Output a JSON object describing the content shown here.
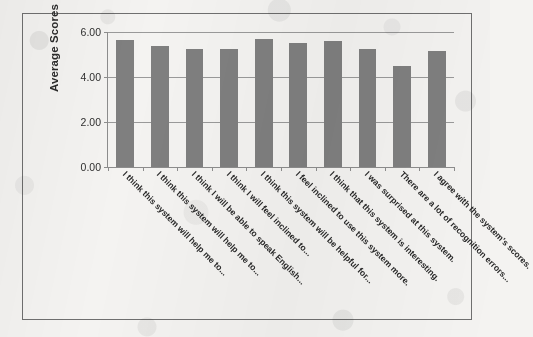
{
  "chart_data": {
    "type": "bar",
    "title": "",
    "xlabel": "",
    "ylabel": "Average Scores",
    "ylim": [
      0,
      6
    ],
    "ytick_labels": [
      "6.00",
      "4.00",
      "2.00",
      "0.00"
    ],
    "ytick_values": [
      6,
      4,
      2,
      0
    ],
    "grid": true,
    "legend": "none",
    "bar_color": "#7f7f7f",
    "categories": [
      "I think this system will help me to...",
      "I think this system will help me to...",
      "I think I will be able to speak English...",
      "I think I will feel inclined to...",
      "I think this system will be helpful for...",
      "I feel inclined to use this system more.",
      "I think that this system is interesting.",
      "I was surprised at this system.",
      "There are a lot of recognition errors...",
      "I agree with the system's scores."
    ],
    "values": [
      5.65,
      5.4,
      5.25,
      5.25,
      5.7,
      5.5,
      5.6,
      5.25,
      4.5,
      5.15
    ]
  },
  "figure": {
    "border_color": "#6f6f6f",
    "background": "#f4f3f1"
  }
}
